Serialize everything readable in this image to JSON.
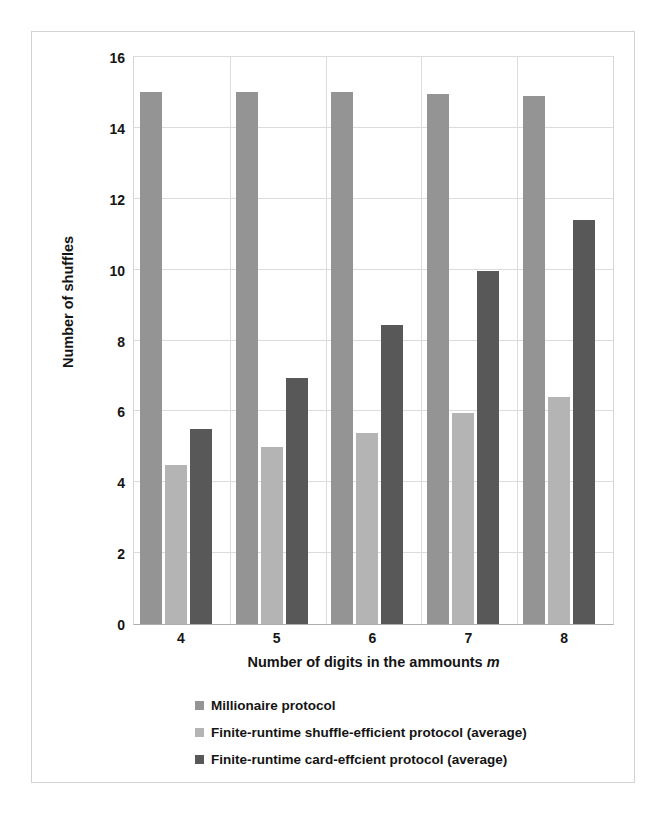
{
  "chart_data": {
    "type": "bar",
    "title": "",
    "xlabel": "Number of digits in the ammounts m",
    "xlabel_plain": "Number of digits in the ammounts ",
    "xlabel_italic": "m",
    "ylabel": "Number of shuffles",
    "categories": [
      "4",
      "5",
      "6",
      "7",
      "8"
    ],
    "ylim": [
      0,
      16
    ],
    "yticks": [
      0,
      2,
      4,
      6,
      8,
      10,
      12,
      14,
      16
    ],
    "grid": true,
    "legend_position": "bottom",
    "series": [
      {
        "name": "Millionaire protocol",
        "color": "#949494",
        "values": [
          15.0,
          15.0,
          15.0,
          14.95,
          14.9
        ]
      },
      {
        "name": "Finite-runtime shuffle-efficient protocol (average)",
        "color": "#b4b4b4",
        "values": [
          4.5,
          5.0,
          5.4,
          5.95,
          6.4
        ]
      },
      {
        "name": "Finite-runtime card-effcient protocol (average)",
        "color": "#585858",
        "values": [
          5.5,
          6.95,
          8.45,
          9.95,
          11.4
        ]
      }
    ]
  },
  "colors": {
    "series1": "#949494",
    "series2": "#b4b4b4",
    "series3": "#585858",
    "gridline": "#dcdcdc",
    "axis": "#aeaeae",
    "frame": "#d2d2d2",
    "background": "#ffffff",
    "text": "#141414"
  }
}
